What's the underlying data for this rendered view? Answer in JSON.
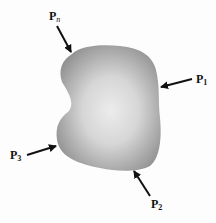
{
  "diagram": {
    "body": {
      "fill_edge": "#9a9a9a",
      "fill_center": "#e6e6e6"
    },
    "forces": [
      {
        "id": "Pn",
        "base": "P",
        "subscript": "n"
      },
      {
        "id": "P1",
        "base": "P",
        "subscript": "1"
      },
      {
        "id": "P2",
        "base": "P",
        "subscript": "2"
      },
      {
        "id": "P3",
        "base": "P",
        "subscript": "3"
      }
    ],
    "arrow_color": "#111111"
  }
}
